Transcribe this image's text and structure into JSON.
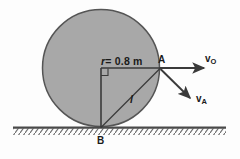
{
  "figure": {
    "background_color": "#fdfdfd",
    "disk": {
      "fill_color": "#a8a8a8",
      "stroke_color": "#555555",
      "center_x": 101,
      "center_y": 68,
      "radius": 58.5,
      "radius_label": {
        "symbol": "r",
        "equals_value": "= 0.8 m",
        "full_text": "r = 0.8 m"
      }
    },
    "ground": {
      "line_color": "#555555",
      "hatch_color": "#666666",
      "x_start": 13,
      "x_end": 226,
      "y": 127.5
    },
    "points": [
      {
        "name": "A",
        "label": "A",
        "x": 159.5,
        "y": 68
      },
      {
        "name": "B",
        "label": "B",
        "x": 101,
        "y": 127.5
      }
    ],
    "segments": [
      {
        "name": "radius-OA",
        "label": "r = 0.8 m",
        "from": "O",
        "to": "A"
      },
      {
        "name": "chord-AB",
        "label": "l",
        "from": "A",
        "to": "B"
      },
      {
        "name": "vertical-OB",
        "label": "",
        "from": "O",
        "to": "B"
      }
    ],
    "right_angle_marker": {
      "at": "O",
      "size": 7
    },
    "vectors": [
      {
        "name": "v-O",
        "label_base": "v",
        "label_sub": "O",
        "label_text": "vO",
        "direction": "horizontal-right",
        "color": "#3a3a3a",
        "from_x": 159.5,
        "from_y": 68,
        "to_x": 206,
        "to_y": 68
      },
      {
        "name": "v-A",
        "label_base": "v",
        "label_sub": "A",
        "label_text": "vA",
        "direction": "down-right",
        "color": "#3a3a3a",
        "from_x": 159.5,
        "from_y": 68,
        "to_x": 192,
        "to_y": 100
      }
    ]
  }
}
